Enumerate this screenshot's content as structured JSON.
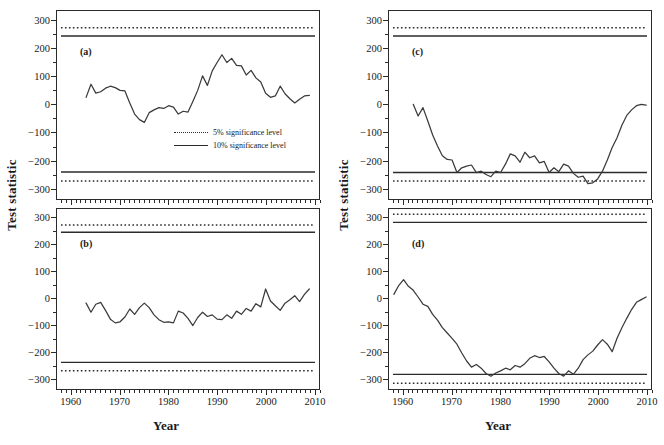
{
  "axes": {
    "ylabel": "Test statistic",
    "xlabel": "Year",
    "xticks": [
      "1960",
      "1970",
      "1980",
      "1990",
      "2000",
      "2010"
    ],
    "yticks": [
      "300",
      "200",
      "100",
      "0",
      "-100",
      "-200",
      "-300"
    ]
  },
  "legend": {
    "items": [
      {
        "label": "5% significance level",
        "style": "dotted"
      },
      {
        "label": "10% significance level",
        "style": "solid"
      }
    ]
  },
  "panels": {
    "a": {
      "tag": "(a)"
    },
    "b": {
      "tag": "(b)"
    },
    "c": {
      "tag": "(c)"
    },
    "d": {
      "tag": "(d)"
    }
  },
  "chart_data": [
    {
      "type": "line",
      "title": "(a)",
      "xlabel": "Year",
      "ylabel": "Test statistic",
      "xlim": [
        1957,
        2011
      ],
      "ylim": [
        -340,
        335
      ],
      "grid": false,
      "legend": "inside-center-right",
      "annotations": [
        "(a)"
      ],
      "sig_levels": {
        "upper_5pct": 275,
        "lower_5pct": -275,
        "upper_10pct": 245,
        "lower_10pct": -243
      },
      "x": [
        1963,
        1964,
        1965,
        1966,
        1967,
        1968,
        1969,
        1970,
        1971,
        1972,
        1973,
        1974,
        1975,
        1976,
        1977,
        1978,
        1979,
        1980,
        1981,
        1982,
        1983,
        1984,
        1985,
        1986,
        1987,
        1988,
        1989,
        1990,
        1991,
        1992,
        1993,
        1994,
        1995,
        1996,
        1997,
        1998,
        1999,
        2000,
        2001,
        2002,
        2003,
        2004,
        2005,
        2006,
        2007,
        2008,
        2009
      ],
      "values": [
        25,
        72,
        40,
        45,
        58,
        65,
        60,
        50,
        48,
        5,
        -35,
        -55,
        -65,
        -30,
        -20,
        -12,
        -15,
        -5,
        -10,
        -35,
        -25,
        -28,
        10,
        50,
        102,
        68,
        120,
        150,
        178,
        150,
        165,
        140,
        138,
        105,
        122,
        95,
        80,
        40,
        25,
        30,
        65,
        38,
        20,
        5,
        18,
        30,
        32
      ]
    },
    {
      "type": "line",
      "title": "(b)",
      "xlabel": "Year",
      "ylabel": "Test statistic",
      "xlim": [
        1957,
        2011
      ],
      "ylim": [
        -340,
        335
      ],
      "grid": false,
      "annotations": [
        "(b)"
      ],
      "sig_levels": {
        "upper_5pct": 275,
        "lower_5pct": -272,
        "upper_10pct": 248,
        "lower_10pct": -240
      },
      "x": [
        1963,
        1964,
        1965,
        1966,
        1967,
        1968,
        1969,
        1970,
        1971,
        1972,
        1973,
        1974,
        1975,
        1976,
        1977,
        1978,
        1979,
        1980,
        1981,
        1982,
        1983,
        1984,
        1985,
        1986,
        1987,
        1988,
        1989,
        1990,
        1991,
        1992,
        1993,
        1994,
        1995,
        1996,
        1997,
        1998,
        1999,
        2000,
        2001,
        2002,
        2003,
        2004,
        2005,
        2006,
        2007,
        2008,
        2009
      ],
      "values": [
        -18,
        -52,
        -22,
        -15,
        -45,
        -78,
        -92,
        -88,
        -70,
        -40,
        -60,
        -35,
        -18,
        -35,
        -62,
        -80,
        -90,
        -88,
        -92,
        -48,
        -55,
        -75,
        -102,
        -72,
        -52,
        -68,
        -62,
        -78,
        -80,
        -62,
        -75,
        -48,
        -60,
        -38,
        -48,
        -20,
        -32,
        35,
        -10,
        -28,
        -45,
        -18,
        -5,
        10,
        -12,
        15,
        35
      ]
    },
    {
      "type": "line",
      "title": "(c)",
      "xlabel": "Year",
      "ylabel": "Test statistic",
      "xlim": [
        1957,
        2011
      ],
      "ylim": [
        -340,
        335
      ],
      "grid": false,
      "annotations": [
        "(c)"
      ],
      "sig_levels": {
        "upper_5pct": 275,
        "lower_5pct": -275,
        "upper_10pct": 245,
        "lower_10pct": -245
      },
      "x": [
        1962,
        1963,
        1964,
        1965,
        1966,
        1967,
        1968,
        1969,
        1970,
        1971,
        1972,
        1973,
        1974,
        1975,
        1976,
        1977,
        1978,
        1979,
        1980,
        1981,
        1982,
        1983,
        1984,
        1985,
        1986,
        1987,
        1988,
        1989,
        1990,
        1991,
        1992,
        1993,
        1994,
        1995,
        1996,
        1997,
        1998,
        1999,
        2000,
        2001,
        2002,
        2003,
        2004,
        2005,
        2006,
        2007,
        2008,
        2009,
        2010
      ],
      "values": [
        0,
        -42,
        -12,
        -60,
        -110,
        -150,
        -185,
        -198,
        -200,
        -245,
        -228,
        -222,
        -218,
        -245,
        -240,
        -252,
        -260,
        -240,
        -245,
        -215,
        -178,
        -185,
        -208,
        -172,
        -192,
        -185,
        -210,
        -205,
        -245,
        -228,
        -242,
        -215,
        -222,
        -248,
        -262,
        -258,
        -285,
        -282,
        -268,
        -240,
        -200,
        -155,
        -120,
        -75,
        -40,
        -20,
        -5,
        0,
        -3
      ]
    },
    {
      "type": "line",
      "title": "(d)",
      "xlabel": "Year",
      "ylabel": "Test statistic",
      "xlim": [
        1957,
        2011
      ],
      "ylim": [
        -340,
        335
      ],
      "grid": false,
      "annotations": [
        "(d)"
      ],
      "sig_levels": {
        "upper_5pct": 315,
        "lower_5pct": -318,
        "upper_10pct": 285,
        "lower_10pct": -285
      },
      "x": [
        1958,
        1959,
        1960,
        1961,
        1962,
        1963,
        1964,
        1965,
        1966,
        1967,
        1968,
        1969,
        1970,
        1971,
        1972,
        1973,
        1974,
        1975,
        1976,
        1977,
        1978,
        1979,
        1980,
        1981,
        1982,
        1983,
        1984,
        1985,
        1986,
        1987,
        1988,
        1989,
        1990,
        1991,
        1992,
        1993,
        1994,
        1995,
        1996,
        1997,
        1998,
        1999,
        2000,
        2001,
        2002,
        2003,
        2004,
        2005,
        2006,
        2007,
        2008,
        2009,
        2010
      ],
      "values": [
        15,
        48,
        70,
        45,
        30,
        5,
        -22,
        -30,
        -60,
        -82,
        -110,
        -130,
        -150,
        -172,
        -205,
        -235,
        -258,
        -248,
        -262,
        -282,
        -292,
        -280,
        -272,
        -262,
        -268,
        -252,
        -258,
        -245,
        -225,
        -215,
        -222,
        -218,
        -238,
        -262,
        -282,
        -292,
        -272,
        -285,
        -262,
        -230,
        -212,
        -198,
        -175,
        -155,
        -172,
        -200,
        -150,
        -110,
        -75,
        -42,
        -15,
        -5,
        5
      ]
    }
  ]
}
